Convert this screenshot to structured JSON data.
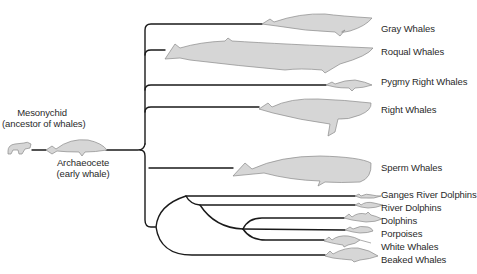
{
  "ancestors": {
    "mesonychid": {
      "name": "Mesonychid",
      "note": "(ancestor of whales)"
    },
    "archaeocete": {
      "name": "Archaeocete",
      "note": "(early whale)"
    }
  },
  "taxa": [
    {
      "id": "gray",
      "label": "Gray Whales"
    },
    {
      "id": "roqual",
      "label": "Roqual Whales"
    },
    {
      "id": "pygmy-right",
      "label": "Pygmy Right Whales"
    },
    {
      "id": "right",
      "label": "Right Whales"
    },
    {
      "id": "sperm",
      "label": "Sperm Whales"
    },
    {
      "id": "ganges",
      "label": "Ganges River Dolphins"
    },
    {
      "id": "river",
      "label": "River Dolphins"
    },
    {
      "id": "dolphins",
      "label": "Dolphins"
    },
    {
      "id": "porpoises",
      "label": "Porpoises"
    },
    {
      "id": "white",
      "label": "White Whales"
    },
    {
      "id": "beaked",
      "label": "Beaked Whales"
    }
  ],
  "colors": {
    "line": "#1a1a1a",
    "silhouette_fill": "#d6d6d6",
    "silhouette_stroke": "#8a8a8a",
    "text": "#2a2a2a"
  }
}
